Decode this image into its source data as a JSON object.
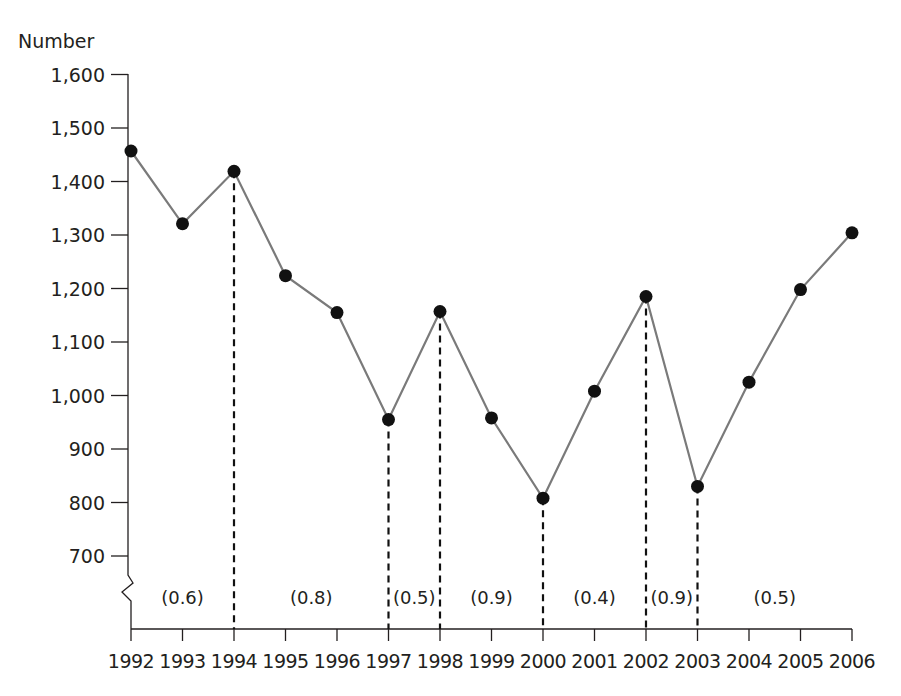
{
  "chart_data": {
    "type": "line",
    "title": "",
    "xlabel": "",
    "ylabel": "Number",
    "ylim": [
      700,
      1600
    ],
    "y_axis_break": true,
    "grid": false,
    "legend": null,
    "yticks": [
      "1,600",
      "1,500",
      "1,400",
      "1,300",
      "1,200",
      "1,100",
      "1,000",
      "900",
      "800",
      "700"
    ],
    "ytick_values": [
      1600,
      1500,
      1400,
      1300,
      1200,
      1100,
      1000,
      900,
      800,
      700
    ],
    "categories": [
      "1992",
      "1993",
      "1994",
      "1995",
      "1996",
      "1997",
      "1998",
      "1999",
      "2000",
      "2001",
      "2002",
      "2003",
      "2004",
      "2005",
      "2006"
    ],
    "series": [
      {
        "name": "Number",
        "values": [
          1457,
          1321,
          1419,
          1224,
          1155,
          955,
          1157,
          958,
          808,
          1008,
          1185,
          830,
          1025,
          1198,
          1304
        ]
      }
    ],
    "dashed_dividers_at": [
      "1994",
      "1997",
      "1998",
      "2000",
      "2002",
      "2003"
    ],
    "period_annotations": [
      {
        "label": "(0.6)",
        "from": "1992",
        "to": "1994"
      },
      {
        "label": "(0.8)",
        "from": "1994",
        "to": "1997"
      },
      {
        "label": "(0.5)",
        "from": "1997",
        "to": "1998"
      },
      {
        "label": "(0.9)",
        "from": "1998",
        "to": "2000"
      },
      {
        "label": "(0.4)",
        "from": "2000",
        "to": "2002"
      },
      {
        "label": "(0.9)",
        "from": "2002",
        "to": "2003"
      },
      {
        "label": "(0.5)",
        "from": "2003",
        "to": "2006"
      }
    ],
    "colors": {
      "line": "#7a7a7a",
      "marker": "#111111",
      "axis": "#231f20",
      "divider": "#111111"
    }
  }
}
